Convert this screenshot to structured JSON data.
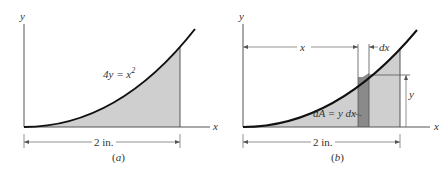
{
  "figures": [
    {
      "id": "a",
      "caption": "(a)",
      "x_axis_label": "x",
      "y_axis_label": "y",
      "equation_label": "4y = x",
      "equation_exponent": "2",
      "dimension_label": "2 in."
    },
    {
      "id": "b",
      "caption": "(b)",
      "x_axis_label": "x",
      "y_axis_label": "y",
      "x_distance_label": "x",
      "dx_label": "dx",
      "y_height_label": "y",
      "element_label": "dA = y dx",
      "dimension_label": "2 in."
    }
  ],
  "colors": {
    "shade": "#cfcfcf",
    "strip": "#8a8a8a",
    "curve": "#111111",
    "line": "#555555"
  }
}
